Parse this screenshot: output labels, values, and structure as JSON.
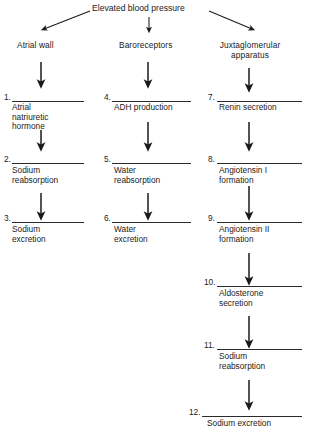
{
  "figure": {
    "title": "Elevated blood pressure",
    "background_color": "#ffffff",
    "ink_color": "#1a1a1a"
  },
  "branches": [
    {
      "id": "left",
      "label": "Atrial wall"
    },
    {
      "id": "middle",
      "label": "Baroreceptors"
    },
    {
      "id": "right",
      "label": "Juxtaglomerular apparatus",
      "label_line1": "Juxtaglomerular",
      "label_line2": "apparatus"
    }
  ],
  "blanks": [
    {
      "number": "1.",
      "column": "left",
      "answer": "Atrial natriuretic hormone",
      "lines": [
        "Atrial",
        "natriuretic",
        "hormone"
      ]
    },
    {
      "number": "2.",
      "column": "left",
      "answer": "Sodium reabsorption",
      "lines": [
        "Sodium",
        "reabsorption"
      ]
    },
    {
      "number": "3.",
      "column": "left",
      "answer": "Sodium excretion",
      "lines": [
        "Sodium",
        "excretion"
      ]
    },
    {
      "number": "4.",
      "column": "middle",
      "answer": "ADH production",
      "lines": [
        "ADH production"
      ]
    },
    {
      "number": "5.",
      "column": "middle",
      "answer": "Water reabsorption",
      "lines": [
        "Water",
        "reabsorption"
      ]
    },
    {
      "number": "6.",
      "column": "middle",
      "answer": "Water excretion",
      "lines": [
        "Water",
        "excretion"
      ]
    },
    {
      "number": "7.",
      "column": "right",
      "answer": "Renin secretion",
      "lines": [
        "Renin secretion"
      ]
    },
    {
      "number": "8.",
      "column": "right",
      "answer": "Angiotensin I formation",
      "lines": [
        "Angiotensin I",
        "formation"
      ]
    },
    {
      "number": "9.",
      "column": "right",
      "answer": "Angiotensin II formation",
      "lines": [
        "Angiotensin II",
        "formation"
      ]
    },
    {
      "number": "10.",
      "column": "right",
      "answer": "Aldosterone secretion",
      "lines": [
        "Aldosterone",
        "secretion"
      ]
    },
    {
      "number": "11.",
      "column": "right",
      "answer": "Sodium reabsorption",
      "lines": [
        "Sodium",
        "reabsorption"
      ]
    },
    {
      "number": "12.",
      "column": "right",
      "answer": "Sodium excretion",
      "lines": [
        "Sodium excretion"
      ]
    }
  ]
}
